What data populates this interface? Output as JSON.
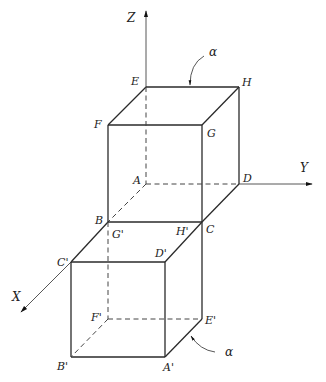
{
  "axes": {
    "z": {
      "label": "Z"
    },
    "y": {
      "label": "Y"
    },
    "x": {
      "label": "X"
    }
  },
  "upper_cube": {
    "vertices": {
      "E": "E",
      "H": "H",
      "F": "F",
      "G": "G",
      "A": "A",
      "D": "D",
      "B": "B",
      "C": "C"
    }
  },
  "lower_cube": {
    "vertices": {
      "G_prime": "G'",
      "H_prime": "H'",
      "C_prime": "C'",
      "D_prime": "D'",
      "F_prime": "F'",
      "E_prime": "E'",
      "B_prime": "B'",
      "A_prime": "A'"
    }
  },
  "annotations": {
    "top_alpha": "α",
    "bottom_alpha": "α"
  }
}
